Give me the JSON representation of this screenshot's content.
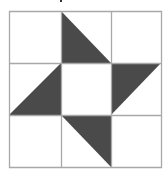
{
  "diagram": {
    "type": "quilt-block",
    "grid": {
      "rows": 3,
      "cols": 3,
      "x_lines": [
        9,
        61,
        111,
        161
      ],
      "y_lines": [
        11,
        63,
        115,
        167
      ],
      "line_color": "#a8a8a8",
      "background": "#ffffff"
    },
    "fill_color": "#4a4a4a",
    "triangles": [
      {
        "cell": "top-middle",
        "points": "61,11 61,63 111,63"
      },
      {
        "cell": "middle-right",
        "points": "111,63 161,63 111,115"
      },
      {
        "cell": "bottom-middle",
        "points": "61,115 111,115 111,167"
      },
      {
        "cell": "middle-left",
        "points": "61,63 61,115 9,115"
      }
    ]
  }
}
